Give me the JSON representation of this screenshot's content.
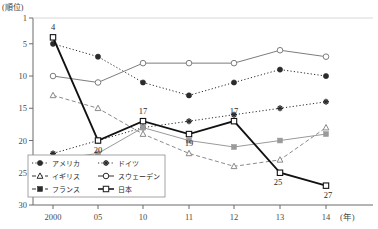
{
  "chart_data": {
    "type": "line",
    "title": "",
    "ylabel": "(順位)",
    "xlabel": "(年)",
    "x": [
      "2000",
      "05",
      "10",
      "11",
      "12",
      "13",
      "14"
    ],
    "categories": [
      "2000",
      "05",
      "10",
      "11",
      "12",
      "13",
      "14"
    ],
    "yticks": [
      1,
      5,
      10,
      15,
      20,
      25,
      30
    ],
    "ylim": [
      1,
      30
    ],
    "y_inverted": true,
    "grid": false,
    "legend_position": "bottom-left",
    "axis_note": "rank axis, lower value = higher rank, drawn inverted",
    "series": [
      {
        "name": "アメリカ",
        "marker": "filled-circle",
        "linestyle": "dotted",
        "color": "#2b2b2b",
        "values": [
          5,
          7,
          11,
          13,
          11,
          9,
          10
        ],
        "labels": [
          "",
          "",
          "",
          "",
          "",
          "",
          ""
        ]
      },
      {
        "name": "ドイツ",
        "marker": "filled-cross",
        "linestyle": "dotted",
        "color": "#2b2b2b",
        "values": [
          22,
          20,
          18,
          17,
          16,
          15,
          14
        ],
        "labels": [
          "",
          "",
          "",
          "",
          "",
          "",
          ""
        ]
      },
      {
        "name": "イギリス",
        "marker": "open-triangle",
        "linestyle": "dashed",
        "color": "#8a8a8a",
        "values": [
          13,
          15,
          19,
          22,
          24,
          23,
          18
        ],
        "labels": [
          "",
          "",
          "",
          "",
          "",
          "",
          ""
        ]
      },
      {
        "name": "スウェーデン",
        "marker": "open-circle",
        "linestyle": "solid",
        "color": "#7d7d7d",
        "values": [
          10,
          11,
          8,
          8,
          8,
          6,
          7
        ],
        "labels": [
          "",
          "",
          "",
          "",
          "",
          "",
          ""
        ]
      },
      {
        "name": "フランス",
        "marker": "filled-square",
        "linestyle": "solid",
        "color": "#9a9a9a",
        "values": [
          23,
          22,
          18,
          20,
          21,
          20,
          19
        ],
        "labels": [
          "",
          "",
          "",
          "",
          "",
          "",
          ""
        ]
      },
      {
        "name": "日本",
        "marker": "open-square",
        "linestyle": "solid-thick",
        "color": "#111111",
        "values": [
          4,
          20,
          17,
          19,
          17,
          25,
          27
        ],
        "labels": [
          "4",
          "20",
          "17",
          "19",
          "17",
          "25",
          "27"
        ]
      }
    ]
  },
  "axis": {
    "unit_label": "(順位)",
    "year_unit": "(年)",
    "tick_labels": [
      "1",
      "5",
      "10",
      "15",
      "20",
      "25",
      "30"
    ],
    "x_labels": [
      "2000",
      "05",
      "10",
      "11",
      "12",
      "13",
      "14"
    ]
  },
  "legend": {
    "entries": [
      {
        "label": "アメリカ",
        "marker": "filled-circle",
        "linestyle": "dotted"
      },
      {
        "label": "ドイツ",
        "marker": "filled-cross",
        "linestyle": "dotted"
      },
      {
        "label": "イギリス",
        "marker": "open-triangle",
        "linestyle": "dashed"
      },
      {
        "label": "スウェーデン",
        "marker": "open-circle",
        "linestyle": "solid"
      },
      {
        "label": "フランス",
        "marker": "filled-square",
        "linestyle": "dashed"
      },
      {
        "label": "日本",
        "marker": "open-square",
        "linestyle": "solid-thick"
      }
    ]
  },
  "caption": {
    "text": ""
  }
}
